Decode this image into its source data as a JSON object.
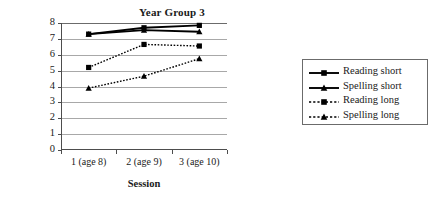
{
  "chart_data": {
    "type": "line",
    "title": "Year Group 3",
    "xlabel": "Session",
    "ylabel": "Mean scores",
    "categories": [
      "1 (age 8)",
      "2 (age 9)",
      "3 (age 10)"
    ],
    "ylim": [
      0,
      8
    ],
    "yticks": [
      "0",
      "1",
      "2",
      "3",
      "4",
      "5",
      "6",
      "7",
      "8"
    ],
    "grid": true,
    "legend_position": "right",
    "series": [
      {
        "name": "Reading short",
        "values": [
          7.3,
          7.7,
          7.85
        ],
        "style": "solid",
        "marker": "square",
        "color": "#000000"
      },
      {
        "name": "Spelling short",
        "values": [
          7.3,
          7.55,
          7.45
        ],
        "style": "solid",
        "marker": "triangle",
        "color": "#000000"
      },
      {
        "name": "Reading long",
        "values": [
          5.2,
          6.65,
          6.55
        ],
        "style": "dotted",
        "marker": "square",
        "color": "#000000"
      },
      {
        "name": "Spelling long",
        "values": [
          3.9,
          4.65,
          5.75
        ],
        "style": "dotted",
        "marker": "triangle",
        "color": "#000000"
      }
    ]
  },
  "axis_color": "#4d4d4d",
  "grid_color": "#a8a8a8",
  "legend_border_color": "#6b6b6b"
}
